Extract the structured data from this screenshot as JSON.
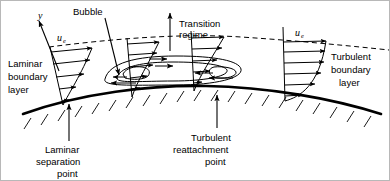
{
  "figure": {
    "background_color": "#ffffff",
    "line_color": "#000000",
    "border_color": "#b8b8b8"
  },
  "axes": {
    "y_axis_label": "y"
  },
  "labels": {
    "bubble": "Bubble",
    "transition_regime_line1": "Transition",
    "transition_regime_line2": "regime",
    "laminar_bl_line1": "Laminar",
    "laminar_bl_line2": "boundary",
    "laminar_bl_line3": "layer",
    "turbulent_bl_line1": "Turbulent",
    "turbulent_bl_line2": "boundary",
    "turbulent_bl_line3": "layer",
    "laminar_sep_line1": "Laminar",
    "laminar_sep_line2": "separation",
    "laminar_sep_line3": "point",
    "turbulent_reattach_line1": "Turbulent",
    "turbulent_reattach_line2": "reattachment",
    "turbulent_reattach_line3": "point"
  },
  "velocity_symbols": {
    "ue_base": "u",
    "ue_subscript": "e",
    "left_profile_label": "u",
    "right_profile_label": "u"
  },
  "profiles": [
    {
      "name": "laminar-profile",
      "type": "laminar",
      "arrow_count": 5,
      "station_x": 68
    },
    {
      "name": "transition-profile-1",
      "type": "transitional",
      "arrow_count": 5,
      "station_x": 136
    },
    {
      "name": "transition-profile-2",
      "type": "transitional",
      "arrow_count": 5,
      "station_x": 196
    },
    {
      "name": "turbulent-profile",
      "type": "turbulent",
      "arrow_count": 6,
      "station_x": 285
    }
  ],
  "recirculation": {
    "name": "separation-bubble",
    "streamline_count": 3,
    "top_flow_direction": "rightward",
    "bottom_flow_direction": "leftward"
  },
  "icons": {
    "arrow": "arrow-icon",
    "hatching": "wall-hatching-icon"
  }
}
